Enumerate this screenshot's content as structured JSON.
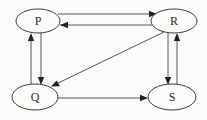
{
  "diagram": {
    "type": "directed-graph",
    "background_color": "#fbfbfa",
    "node_stroke_color": "#3a3a3a",
    "edge_color": "#555555",
    "label_color": "#2b2b2b",
    "nodes": [
      {
        "id": "P",
        "label": "P",
        "cx": 38,
        "cy": 21,
        "rx": 22,
        "ry": 12
      },
      {
        "id": "R",
        "label": "R",
        "cx": 174,
        "cy": 21,
        "rx": 23,
        "ry": 12
      },
      {
        "id": "Q",
        "label": "Q",
        "cx": 35,
        "cy": 97,
        "rx": 23,
        "ry": 13
      },
      {
        "id": "S",
        "label": "S",
        "cx": 172,
        "cy": 97,
        "rx": 24,
        "ry": 13
      }
    ],
    "edges": [
      {
        "id": "P-to-R",
        "from": "P",
        "to": "R",
        "shape": "horizontal-top",
        "direction": "right"
      },
      {
        "id": "R-to-P",
        "from": "R",
        "to": "P",
        "shape": "horizontal-bottom",
        "direction": "left"
      },
      {
        "id": "Q-to-P",
        "from": "Q",
        "to": "P",
        "shape": "vertical-left",
        "direction": "up"
      },
      {
        "id": "P-to-Q",
        "from": "P",
        "to": "Q",
        "shape": "vertical-right",
        "direction": "down"
      },
      {
        "id": "R-to-S",
        "from": "R",
        "to": "S",
        "shape": "vertical-left",
        "direction": "down"
      },
      {
        "id": "S-to-R",
        "from": "S",
        "to": "R",
        "shape": "vertical-right",
        "direction": "up"
      },
      {
        "id": "Q-to-S",
        "from": "Q",
        "to": "S",
        "shape": "horizontal",
        "direction": "right"
      },
      {
        "id": "R-to-Q",
        "from": "R",
        "to": "Q",
        "shape": "diagonal",
        "direction": "down-left"
      }
    ]
  }
}
